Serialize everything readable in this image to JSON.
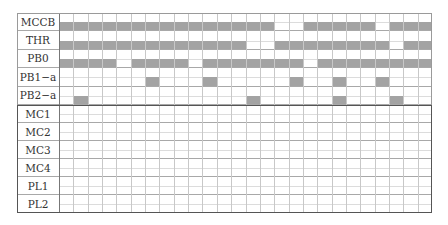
{
  "diagram": {
    "type": "timing-chart",
    "columns": 26,
    "colors": {
      "bar": "#a3a3a3",
      "grid": "#c8c8c8",
      "border": "#555555"
    },
    "signals": [
      {
        "name": "MCCB",
        "on_cols": [
          0,
          1,
          2,
          3,
          4,
          5,
          6,
          7,
          8,
          9,
          10,
          11,
          12,
          13,
          14,
          17,
          18,
          19,
          20,
          21,
          23,
          24,
          25
        ]
      },
      {
        "name": "THR",
        "on_cols": [
          0,
          1,
          2,
          3,
          4,
          5,
          6,
          7,
          8,
          9,
          10,
          11,
          12,
          15,
          16,
          17,
          18,
          19,
          20,
          21,
          22,
          24,
          25
        ]
      },
      {
        "name": "PB0",
        "on_cols": [
          0,
          1,
          2,
          3,
          5,
          6,
          7,
          8,
          10,
          11,
          12,
          13,
          14,
          15,
          16,
          18,
          19,
          20,
          21,
          22,
          23,
          24,
          25
        ]
      },
      {
        "name": "PB1−a",
        "on_cols": [
          6,
          10,
          16,
          19,
          22
        ]
      },
      {
        "name": "PB2−a",
        "on_cols": [
          1,
          13,
          19,
          23
        ]
      }
    ],
    "outputs": [
      {
        "name": "MC1",
        "on_cols": []
      },
      {
        "name": "MC2",
        "on_cols": []
      },
      {
        "name": "MC3",
        "on_cols": []
      },
      {
        "name": "MC4",
        "on_cols": []
      },
      {
        "name": "PL1",
        "on_cols": []
      },
      {
        "name": "PL2",
        "on_cols": []
      }
    ]
  }
}
